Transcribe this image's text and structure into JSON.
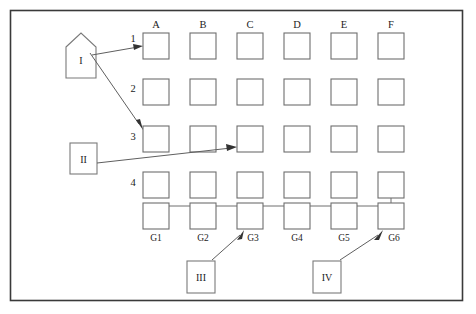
{
  "diagram": {
    "title": "",
    "frame": {
      "x": 10,
      "y": 10,
      "width": 453,
      "height": 291
    },
    "colors": {
      "frame_stroke": "#3a3a3a",
      "cell_stroke": "#6e6e6e",
      "line_stroke": "#5f5f5f",
      "arrow_fill": "#333333",
      "background": "#ffffff"
    },
    "grid": {
      "column_labels": [
        "A",
        "B",
        "C",
        "D",
        "E",
        "F"
      ],
      "row_labels": [
        "1",
        "2",
        "3",
        "4"
      ],
      "cell_size": 26,
      "col_pitch": 47,
      "row_pitch": 46,
      "origin_x": 143,
      "origin_y": 33
    },
    "bottom_row": {
      "labels": [
        "G1",
        "G2",
        "G3",
        "G4",
        "G5",
        "G6"
      ],
      "cell_size": 26,
      "col_pitch": 47,
      "origin_x": 143,
      "origin_y": 203
    },
    "nodes": [
      {
        "id": "node-i",
        "label": "I",
        "shape": "house",
        "x": 66,
        "y": 33,
        "width": 30,
        "height": 45
      },
      {
        "id": "node-ii",
        "label": "II",
        "shape": "rectangle",
        "x": 70,
        "y": 143,
        "width": 27,
        "height": 31
      },
      {
        "id": "node-iii",
        "label": "III",
        "shape": "rectangle",
        "x": 187,
        "y": 261,
        "width": 28,
        "height": 32
      },
      {
        "id": "node-iv",
        "label": "IV",
        "shape": "rectangle",
        "x": 313,
        "y": 261,
        "width": 28,
        "height": 32
      }
    ],
    "connectors": [
      {
        "id": "conn-i-to-a1",
        "from": "node-i",
        "to": "cell-A1",
        "type": "straight-arrow"
      },
      {
        "id": "conn-i-to-a3",
        "from": "node-i",
        "to": "cell-A3",
        "type": "straight-arrow"
      },
      {
        "id": "conn-ii-to-c3",
        "from": "node-ii",
        "to": "cell-C3",
        "type": "straight-arrow"
      },
      {
        "id": "conn-f4-to-g1",
        "from": "cell-F4",
        "to": "cell-G1",
        "type": "elbow"
      },
      {
        "id": "conn-iii-to-g3",
        "from": "node-iii",
        "to": "cell-G3",
        "type": "straight-arrow"
      },
      {
        "id": "conn-iv-to-g6",
        "from": "node-iv",
        "to": "cell-G6",
        "type": "straight-arrow"
      }
    ]
  }
}
